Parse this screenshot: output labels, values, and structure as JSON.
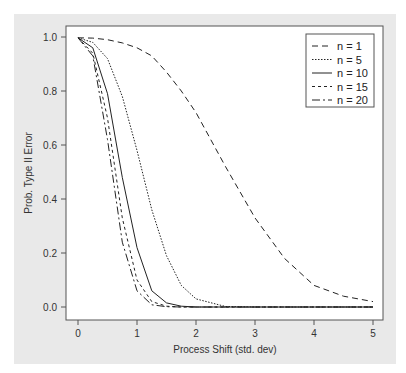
{
  "chart_data": {
    "type": "line",
    "title": "",
    "xlabel": "Process Shift (std. dev)",
    "ylabel": "Prob. Type II Error",
    "xlim": [
      -0.15,
      5.2
    ],
    "ylim": [
      -0.04,
      1.04
    ],
    "xticks": [
      0,
      1,
      2,
      3,
      4,
      5
    ],
    "xtick_labels": [
      "0",
      "1",
      "2",
      "3",
      "4",
      "5"
    ],
    "yticks": [
      0.0,
      0.2,
      0.4,
      0.6,
      0.8,
      1.0
    ],
    "ytick_labels": [
      "0.0",
      "0.2",
      "0.4",
      "0.6",
      "0.8",
      "1.0"
    ],
    "grid": false,
    "legend_position": "upper right",
    "x": [
      0,
      0.25,
      0.5,
      0.75,
      1.0,
      1.25,
      1.5,
      1.75,
      2.0,
      2.5,
      3.0,
      3.5,
      4.0,
      4.5,
      5.0
    ],
    "series": [
      {
        "name": "n = 1",
        "dash": "6,4",
        "values": [
          0.997,
          0.996,
          0.99,
          0.978,
          0.96,
          0.93,
          0.87,
          0.8,
          0.72,
          0.52,
          0.33,
          0.18,
          0.08,
          0.04,
          0.02
        ]
      },
      {
        "name": "n = 5",
        "dash": "1.5,1.5",
        "values": [
          0.997,
          0.98,
          0.92,
          0.78,
          0.58,
          0.36,
          0.19,
          0.08,
          0.03,
          0.002,
          0.0,
          0.0,
          0.0,
          0.0,
          0.0
        ]
      },
      {
        "name": "n = 10",
        "dash": "",
        "values": [
          0.997,
          0.96,
          0.79,
          0.48,
          0.22,
          0.06,
          0.015,
          0.003,
          0.0,
          0.0,
          0.0,
          0.0,
          0.0,
          0.0,
          0.0
        ]
      },
      {
        "name": "n = 15",
        "dash": "3,3",
        "values": [
          0.997,
          0.94,
          0.7,
          0.33,
          0.1,
          0.02,
          0.003,
          0.0,
          0.0,
          0.0,
          0.0,
          0.0,
          0.0,
          0.0,
          0.0
        ]
      },
      {
        "name": "n = 20",
        "dash": "8,3,2,3",
        "values": [
          0.997,
          0.93,
          0.62,
          0.24,
          0.06,
          0.008,
          0.001,
          0.0,
          0.0,
          0.0,
          0.0,
          0.0,
          0.0,
          0.0,
          0.0
        ]
      }
    ]
  }
}
